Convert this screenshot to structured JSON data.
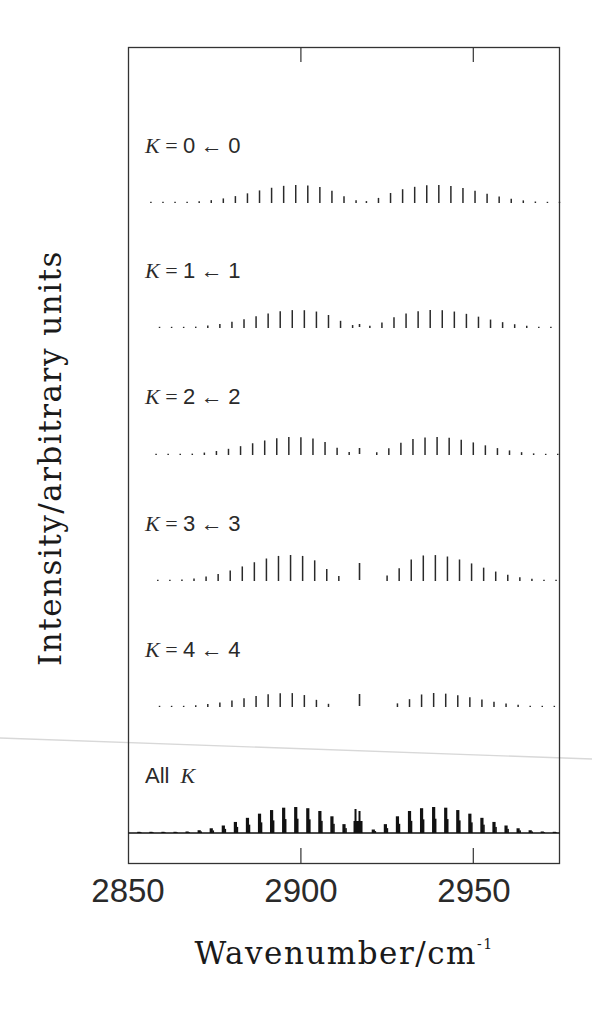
{
  "chart_data": {
    "type": "bar",
    "subtype": "stacked stick spectra",
    "title": "",
    "xlabel": "Wavenumber/cm",
    "xlabel_superscript": "-1",
    "ylabel": "Intensity/arbitrary units",
    "xlim": [
      2850,
      2975
    ],
    "xticks": [
      2850,
      2900,
      2950
    ],
    "x_tick_labels": [
      "2850",
      "2900",
      "2950"
    ],
    "grid": false,
    "legend": null,
    "line_spacing_cm": 3.5,
    "series": [
      {
        "name": "K = 0 ← 0",
        "k": 0,
        "start": 2856,
        "end": 2975,
        "p_center": 2899,
        "p_end": 2916,
        "q_line": null,
        "r_start": 2919,
        "r_center": 2939,
        "max_height": 18,
        "q_height": 0
      },
      {
        "name": "K = 1 ← 1",
        "k": 1,
        "start": 2857,
        "end": 2975,
        "p_center": 2899,
        "p_end": 2915,
        "q_line": 2917,
        "r_start": 2920,
        "r_center": 2939,
        "max_height": 18,
        "q_height": 4
      },
      {
        "name": "K = 2 ← 2",
        "k": 2,
        "start": 2856,
        "end": 2975,
        "p_center": 2898,
        "p_end": 2914,
        "q_line": 2917,
        "r_start": 2922,
        "r_center": 2939,
        "max_height": 18,
        "q_height": 7
      },
      {
        "name": "K = 3 ← 3",
        "k": 3,
        "start": 2856,
        "end": 2975,
        "p_center": 2897,
        "p_end": 2911,
        "q_line": 2917,
        "r_start": 2925,
        "r_center": 2938,
        "max_height": 26,
        "q_height": 18
      },
      {
        "name": "K = 4 ← 4",
        "k": 4,
        "start": 2858,
        "end": 2975,
        "p_center": 2896,
        "p_end": 2908,
        "q_line": 2917,
        "r_start": 2928,
        "r_center": 2938,
        "max_height": 14,
        "q_height": 13
      },
      {
        "name": "All K",
        "k": "all",
        "start": 2850,
        "end": 2975,
        "p_center": 2898,
        "p_end": 2916,
        "q_line": 2917,
        "r_start": 2921,
        "r_center": 2939,
        "max_height": 26,
        "q_height": 24
      }
    ]
  },
  "labels": {
    "rows": [
      {
        "k": "K",
        "eq": " = ",
        "upper": "0",
        "arrow": " ←",
        "lower": "0"
      },
      {
        "k": "K",
        "eq": " = ",
        "upper": "1",
        "arrow": " ←",
        "lower": "1"
      },
      {
        "k": "K",
        "eq": " = ",
        "upper": "2",
        "arrow": " ←",
        "lower": "2"
      },
      {
        "k": "K",
        "eq": " = ",
        "upper": "3",
        "arrow": " ←",
        "lower": "3"
      },
      {
        "k": "K",
        "eq": " = ",
        "upper": "4",
        "arrow": " ←",
        "lower": "4"
      }
    ],
    "all_prefix": "All",
    "all_k": "K",
    "ylabel": "Intensity/arbitrary units",
    "xlabel": "Wavenumber/cm",
    "xlabel_sup": "-1",
    "ticks": [
      "2850",
      "2900",
      "2950"
    ]
  }
}
